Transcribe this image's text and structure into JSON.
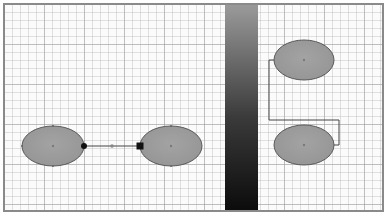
{
  "canvas": {
    "width": 385,
    "height": 214,
    "background": "#ffffff",
    "grid": {
      "minor_spacing": 8,
      "major_spacing": 40,
      "minor_color": "#bebebe",
      "major_color": "#969696"
    },
    "border_color": "#8a8a8a"
  },
  "gradient_bar": {
    "x": 223,
    "width": 33,
    "top_color": "#9a9a9a",
    "mid_color": "#3a3a3a",
    "bottom_color": "#0c0c0c"
  },
  "style": {
    "node_fill": "#9b9b9b",
    "node_stroke": "#5a5a5a",
    "edge_color": "#444444",
    "marker_color": "#111111",
    "center_dot_color": "#7a7a7a"
  },
  "left_diagram": {
    "nodes": [
      {
        "id": "left-node-a",
        "cx": 53,
        "cy": 146,
        "rx": 31,
        "ry": 20
      },
      {
        "id": "left-node-b",
        "cx": 171,
        "cy": 146,
        "rx": 31,
        "ry": 20
      }
    ],
    "edge": {
      "x1": 84,
      "y1": 146,
      "x2": 140,
      "y2": 146,
      "start_marker": "circle",
      "mid_marker_x": 112,
      "end_marker": "square"
    }
  },
  "right_diagram": {
    "nodes": [
      {
        "id": "right-node-top",
        "cx": 304,
        "cy": 60,
        "rx": 30,
        "ry": 20
      },
      {
        "id": "right-node-bottom",
        "cx": 304,
        "cy": 145,
        "rx": 30,
        "ry": 20
      }
    ],
    "edge": {
      "points": "274,60 269,60 269,120 339,120 339,145 334,145"
    }
  }
}
